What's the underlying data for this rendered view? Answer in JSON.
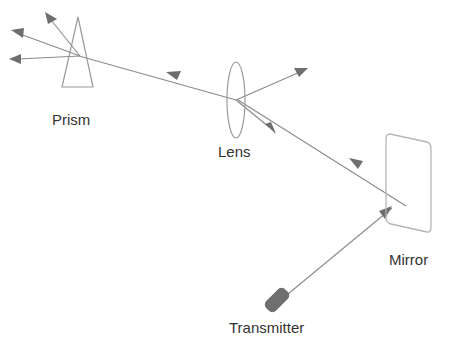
{
  "diagram": {
    "background_color": "#ffffff",
    "stroke_color": "#8a8a8a",
    "arrow_color": "#6e6e6e",
    "device_fill_color": "#6f6f6f",
    "label_color": "#333333",
    "labels": {
      "prism": "Prism",
      "lens": "Lens",
      "mirror": "Mirror",
      "transmitter": "Transmitter"
    },
    "components": [
      {
        "name": "prism",
        "label": "Prism",
        "shape": "triangle",
        "apex": [
          78,
          17
        ],
        "base_left": [
          62,
          87
        ],
        "base_right": [
          93,
          87
        ]
      },
      {
        "name": "lens",
        "label": "Lens",
        "shape": "ellipse",
        "center": [
          236,
          100
        ],
        "rx": 9,
        "ry": 38
      },
      {
        "name": "mirror",
        "label": "Mirror",
        "shape": "rounded-quadrilateral",
        "corners": [
          [
            386,
            134
          ],
          [
            431,
            143
          ],
          [
            431,
            232
          ],
          [
            386,
            223
          ]
        ]
      },
      {
        "name": "transmitter",
        "label": "Transmitter",
        "shape": "rounded-rectangle",
        "center": [
          277,
          300
        ],
        "rotation_deg": -45,
        "width": 26,
        "height": 13
      }
    ],
    "rays": [
      {
        "name": "transmitter-to-mirror",
        "from": "transmitter",
        "to": "mirror",
        "start": [
          286,
          292
        ],
        "end": [
          391,
          207
        ],
        "arrow_at_end": true
      },
      {
        "name": "mirror-to-lens",
        "from": "mirror",
        "to": "lens",
        "start": [
          404,
          205
        ],
        "end": [
          237,
          100
        ],
        "arrow_at_end": true
      },
      {
        "name": "lens-to-prism",
        "from": "lens",
        "to": "prism",
        "start": [
          236,
          100
        ],
        "end": [
          80,
          56
        ],
        "arrow_at_end": true
      },
      {
        "name": "lens-scatter-up-right",
        "from": "lens",
        "to": "free-space",
        "start": [
          236,
          100
        ],
        "end": [
          307,
          69
        ],
        "arrow_at_end": true
      },
      {
        "name": "lens-scatter-down-right",
        "from": "lens",
        "to": "free-space",
        "start": [
          236,
          100
        ],
        "end": [
          274,
          133
        ],
        "arrow_at_end": true
      },
      {
        "name": "prism-dispersion-up",
        "from": "prism",
        "to": "free-space",
        "start": [
          80,
          56
        ],
        "end": [
          47,
          14
        ],
        "arrow_at_end": true
      },
      {
        "name": "prism-dispersion-mid",
        "from": "prism",
        "to": "free-space",
        "start": [
          80,
          56
        ],
        "end": [
          13,
          32
        ],
        "arrow_at_end": true
      },
      {
        "name": "prism-dispersion-low",
        "from": "prism",
        "to": "free-space",
        "start": [
          80,
          56
        ],
        "end": [
          11,
          58
        ],
        "arrow_at_end": true
      }
    ]
  }
}
